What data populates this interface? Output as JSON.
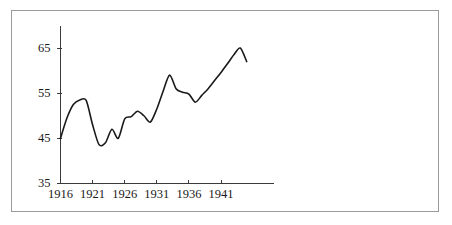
{
  "chart_data": {
    "type": "line",
    "title": "",
    "subtitle": "",
    "xlabel": "",
    "ylabel": "",
    "grid": false,
    "legend": false,
    "legend_position": "none",
    "xlim": [
      1916,
      1945
    ],
    "ylim": [
      35,
      68
    ],
    "xticks": [
      1916,
      1921,
      1926,
      1931,
      1936,
      1941
    ],
    "xtick_labels": [
      "1916",
      "1921",
      "1926",
      "1931",
      "1936",
      "1941"
    ],
    "yticks": [
      35,
      45,
      55,
      65
    ],
    "ytick_labels": [
      "35",
      "45",
      "55",
      "65"
    ],
    "series": [
      {
        "name": "series-1",
        "color": "#1a1a1a",
        "x": [
          1916,
          1917,
          1918,
          1919,
          1920,
          1921,
          1922,
          1923,
          1924,
          1925,
          1926,
          1927,
          1928,
          1929,
          1930,
          1931,
          1932,
          1933,
          1934,
          1935,
          1936,
          1937,
          1938,
          1939,
          1940,
          1941,
          1942,
          1943,
          1944,
          1945
        ],
        "values": [
          45.0,
          49.5,
          52.5,
          53.5,
          53.4,
          48.0,
          43.6,
          44.0,
          47.0,
          45.0,
          49.3,
          49.8,
          51.0,
          50.0,
          48.6,
          51.5,
          55.5,
          59.0,
          56.0,
          55.2,
          54.8,
          53.0,
          54.5,
          56.0,
          57.8,
          59.6,
          61.5,
          63.5,
          65.0,
          62.0
        ]
      }
    ],
    "axis_color": "#3a3a3a",
    "line_color": "#1a1a1a",
    "frame_color": "#9a9a9a",
    "background_color": "#ffffff"
  },
  "figure": {
    "frame_label": "chart-border",
    "caption": ""
  }
}
